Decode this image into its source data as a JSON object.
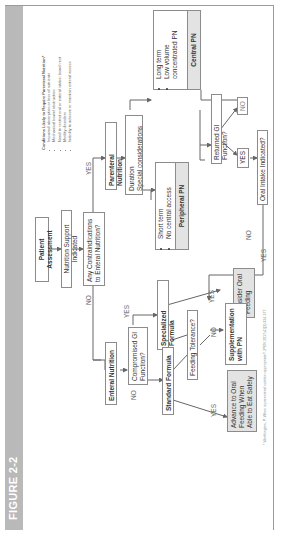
{
  "figure": {
    "title": "FIGURE 2-2",
    "header_color": "#b9b9b9"
  },
  "conditions": {
    "title": "Conditions Likely to Require Parenteral Nutrition*",
    "items": [
      "Impaired absorption or loss of nutrients",
      "Mechanical bowel obstruction",
      "Need to restrict oral or enteral intake: bowel rest",
      "Motility disorders",
      "Inability to achieve or maintain enteral access"
    ]
  },
  "nodes": {
    "patient_assessment": "Patient Assessment",
    "nutrition_support": "Nutrition Support Indicated",
    "contraindications": "Any Contraindications to Enteral Nutrition?",
    "parenteral_nutrition": "Parenteral Nutrition",
    "duration": "Duration",
    "special_considerations": "Special considerations",
    "short_term_items": [
      "Short term",
      "No central access"
    ],
    "peripheral_pn": "Peripheral PN",
    "long_term_items": [
      "Long term",
      "Low volume concentrated PN"
    ],
    "central_pn": "Central PN",
    "returned_gi": "Returned GI Function?",
    "oral_intake": "Oral Intake Indicated?",
    "consider_oral": "Consider Oral Feeding",
    "enteral_nutrition": "Enteral Nutrition",
    "compromised_gi": "Compromised GI Function?",
    "specialized_formula": "Specialized Formula",
    "standard_formula": "Standard Formula",
    "feeding_tolerance": "Feeding Tolerance?",
    "supplementation": "Supplementation with PN",
    "advance_oral": "Advance to Oral Feeding When Able to Eat Safely"
  },
  "labels": {
    "yes": "YES",
    "no": "NO"
  },
  "footnote": "* Worthington, P. When is parenteral nutrition appropriate? JPEN 2017;41(3):324-377."
}
